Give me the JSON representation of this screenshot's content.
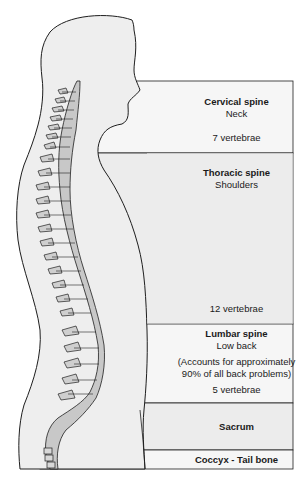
{
  "figure": {
    "colors": {
      "outline": "#1e1e1e",
      "body_fill": "#efefef",
      "spine_fill": "#c8c8c8",
      "band_light": "#f7f7f7",
      "band_shade": "#ebebeb",
      "background": "#ffffff"
    },
    "regions": [
      {
        "id": "cervical",
        "title": "Cervical spine",
        "subtitle": "Neck",
        "note": "",
        "count": "7 vertebrae"
      },
      {
        "id": "thoracic",
        "title": "Thoracic spine",
        "subtitle": "Shoulders",
        "note": "",
        "count": "12 vertebrae"
      },
      {
        "id": "lumbar",
        "title": "Lumbar spine",
        "subtitle": "Low back",
        "note_line1": "(Accounts for approximately",
        "note_line2": "90% of all back problems)",
        "count": "5 vertebrae"
      },
      {
        "id": "sacrum",
        "title": "Sacrum"
      },
      {
        "id": "coccyx",
        "title": "Coccyx - Tail bone"
      }
    ]
  }
}
